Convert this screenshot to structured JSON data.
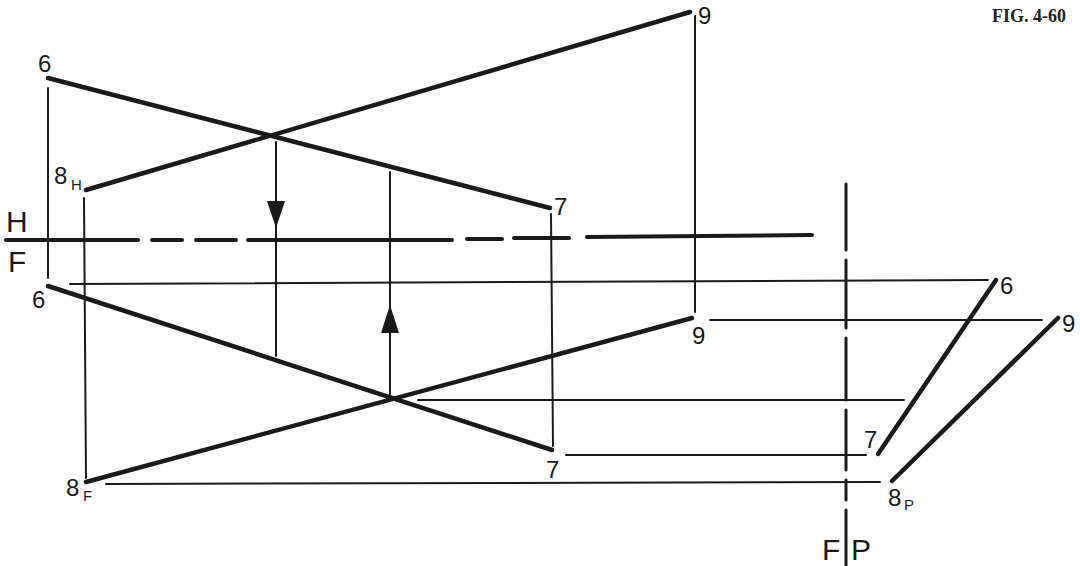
{
  "figure": {
    "caption": "FIG. 4-60",
    "ink_color": "#1a1a1a",
    "background": "#ffffff"
  },
  "fold_lines": {
    "hf": {
      "upper": "H",
      "lower": "F"
    },
    "fp": {
      "left": "F",
      "right": "P"
    }
  },
  "labels": {
    "top_6": "6",
    "top_7": "7",
    "top_8": "8",
    "top_8_sub": "H",
    "top_9": "9",
    "front_6": "6",
    "front_7": "7",
    "front_8": "8",
    "front_8_sub": "F",
    "front_9": "9",
    "profile_6": "6",
    "profile_7": "7",
    "profile_8": "8",
    "profile_8_sub": "P",
    "profile_9": "9"
  }
}
